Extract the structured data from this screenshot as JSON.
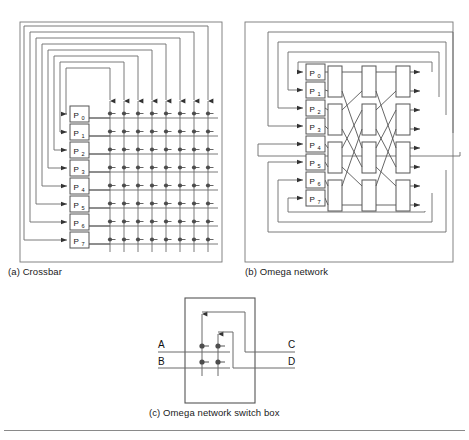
{
  "figure": {
    "background_color": "#ffffff",
    "line_color": "#555555",
    "box_fill": "#ffffff",
    "node_color": "#4d4d4d"
  },
  "panels": [
    {
      "id": "crossbar",
      "caption": "(a) Crossbar",
      "processors": [
        "P",
        "P",
        "P",
        "P",
        "P",
        "P",
        "P",
        "P"
      ],
      "processor_labels": [
        "P0",
        "P1",
        "P2",
        "P3",
        "P4",
        "P5",
        "P6",
        "P7"
      ],
      "processor_subscripts": [
        "0",
        "1",
        "2",
        "3",
        "4",
        "5",
        "6",
        "7"
      ],
      "rows": 8,
      "columns": 8,
      "crosspoints": 64,
      "loopback_count": 8
    },
    {
      "id": "omega",
      "caption": "(b) Omega network",
      "processor_labels": [
        "P0",
        "P1",
        "P2",
        "P3",
        "P4",
        "P5",
        "P6",
        "P7"
      ],
      "processor_subscripts": [
        "0",
        "1",
        "2",
        "3",
        "4",
        "5",
        "6",
        "7"
      ],
      "stages": 3,
      "switches_per_stage": 4,
      "total_switches": 12,
      "loopback_count": 8
    },
    {
      "id": "switchbox",
      "caption": "(c) Omega network switch box",
      "inputs": [
        "A",
        "B"
      ],
      "outputs": [
        "C",
        "D"
      ],
      "crosspoints": 4
    }
  ],
  "captions": {
    "a": "(a) Crossbar",
    "b": "(b) Omega network",
    "c": "(c) Omega network switch box"
  },
  "labels": {
    "p_letter": "P",
    "subscripts": [
      "0",
      "1",
      "2",
      "3",
      "4",
      "5",
      "6",
      "7"
    ],
    "switch_in_a": "A",
    "switch_in_b": "B",
    "switch_out_c": "C",
    "switch_out_d": "D"
  }
}
